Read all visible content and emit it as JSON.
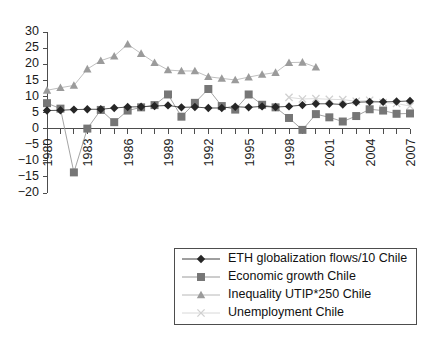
{
  "chart_data": {
    "type": "line",
    "title": "",
    "subtitle": "",
    "xlabel": "",
    "ylabel": "",
    "xlim": [
      1980,
      2007
    ],
    "ylim": [
      -20,
      30
    ],
    "ytick_step": 5,
    "yticks": [
      30,
      25,
      20,
      15,
      10,
      5,
      0,
      -5,
      -10,
      -15,
      -20
    ],
    "ytick_labels": [
      "30",
      "25",
      "20",
      "15",
      "10",
      "5",
      "0",
      "−5",
      "−10",
      "−15",
      "−20"
    ],
    "x": [
      1980,
      1981,
      1982,
      1983,
      1984,
      1985,
      1986,
      1987,
      1988,
      1989,
      1990,
      1991,
      1992,
      1993,
      1994,
      1995,
      1996,
      1997,
      1998,
      1999,
      2000,
      2001,
      2002,
      2003,
      2004,
      2005,
      2006,
      2007
    ],
    "xtick_labels": [
      "1980",
      "1983",
      "1986",
      "1989",
      "1992",
      "1995",
      "1998",
      "2001",
      "2004",
      "2007"
    ],
    "xtick_label_years": [
      1980,
      1983,
      1986,
      1989,
      1992,
      1995,
      1998,
      2001,
      2004,
      2007
    ],
    "xtick_minor_years": [
      1980,
      1981,
      1982,
      1983,
      1984,
      1985,
      1986,
      1987,
      1988,
      1989,
      1990,
      1991,
      1992,
      1993,
      1994,
      1995,
      1996,
      1997,
      1998,
      1999,
      2000,
      2001,
      2002,
      2003,
      2004,
      2005,
      2006,
      2007
    ],
    "grid": false,
    "legend_position": "bottom-right",
    "series": [
      {
        "name": "ETH globalization flows/10 Chile",
        "marker": "diamond",
        "color": "#262626",
        "line_color": "#3f3f3f",
        "values": [
          5.6,
          5.7,
          5.9,
          6.0,
          6.0,
          6.4,
          6.7,
          6.8,
          7.0,
          7.2,
          6.6,
          6.7,
          6.4,
          6.4,
          6.8,
          6.6,
          6.9,
          6.7,
          6.9,
          7.3,
          7.7,
          7.7,
          7.5,
          8.2,
          8.3,
          8.3,
          8.4,
          8.6
        ]
      },
      {
        "name": "Economic growth Chile",
        "marker": "square",
        "color": "#767676",
        "line_color": "#9a9a9a",
        "values": [
          7.9,
          6.2,
          -13.6,
          0.0,
          5.8,
          2.0,
          5.6,
          6.6,
          7.3,
          10.6,
          3.7,
          8.0,
          12.3,
          7.0,
          5.9,
          10.6,
          7.4,
          6.6,
          3.3,
          -0.4,
          4.5,
          3.5,
          2.2,
          3.9,
          6.0,
          5.6,
          4.6,
          4.7
        ]
      },
      {
        "name": "Inequality UTIP*250 Chile",
        "marker": "triangle",
        "color": "#9b9b9b",
        "line_color": "#b8b8b8",
        "values": [
          11.9,
          12.7,
          13.4,
          18.5,
          21.1,
          22.5,
          26.2,
          23.3,
          20.5,
          18.2,
          17.9,
          17.9,
          16.1,
          15.6,
          15.1,
          16.0,
          16.8,
          17.4,
          20.5,
          20.6,
          19.1,
          null,
          null,
          null,
          null,
          null,
          null,
          null
        ]
      },
      {
        "name": "Unemployment Chile",
        "marker": "x",
        "color": "#d0d0d0",
        "line_color": "#d8d8d8",
        "values": [
          null,
          null,
          null,
          null,
          null,
          null,
          null,
          null,
          null,
          null,
          null,
          null,
          null,
          null,
          null,
          null,
          null,
          null,
          9.7,
          9.2,
          9.3,
          9.1,
          9.0,
          8.5,
          8.8,
          8.1,
          7.8,
          7.0
        ]
      }
    ]
  },
  "legend": {
    "items": [
      {
        "label": "ETH globalization flows/10 Chile"
      },
      {
        "label": "Economic growth Chile"
      },
      {
        "label": "Inequality UTIP*250 Chile"
      },
      {
        "label": "Unemployment Chile"
      }
    ]
  },
  "colors": {
    "axis": "#4d4d4d",
    "text": "#1a1a1a",
    "background": "#ffffff",
    "series_diamond": "#262626",
    "series_square": "#767676",
    "series_triangle": "#9b9b9b",
    "series_x": "#d0d0d0"
  }
}
